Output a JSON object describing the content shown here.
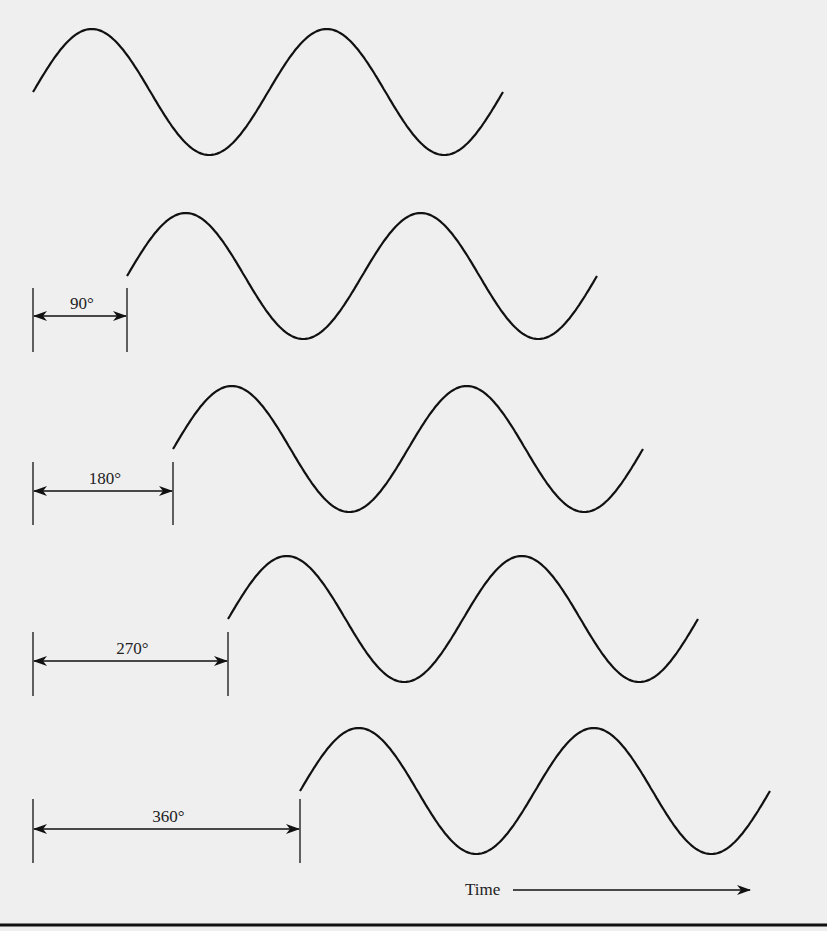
{
  "figure": {
    "waves": [
      {
        "name": "reference",
        "phase_deg": 0,
        "start_x": 33,
        "mid_y": 92
      },
      {
        "name": "shift-90",
        "phase_deg": 90,
        "start_x": 127,
        "mid_y": 276
      },
      {
        "name": "shift-180",
        "phase_deg": 180,
        "start_x": 173,
        "mid_y": 449
      },
      {
        "name": "shift-270",
        "phase_deg": 270,
        "start_x": 228,
        "mid_y": 619
      },
      {
        "name": "shift-360",
        "phase_deg": 360,
        "start_x": 300,
        "mid_y": 791
      }
    ],
    "dimension_labels": [
      {
        "text": "90°",
        "x1": 33,
        "x2": 127,
        "y": 316,
        "tick_top": 288,
        "tick_bottom": 352
      },
      {
        "text": "180°",
        "x1": 33,
        "x2": 173,
        "y": 491,
        "tick_top": 462,
        "tick_bottom": 525
      },
      {
        "text": "270°",
        "x1": 33,
        "x2": 228,
        "y": 661,
        "tick_top": 632,
        "tick_bottom": 696
      },
      {
        "text": "360°",
        "x1": 33,
        "x2": 300,
        "y": 829,
        "tick_top": 799,
        "tick_bottom": 863
      }
    ],
    "time_axis": {
      "label": "Time",
      "arrow_x1": 513,
      "arrow_x2": 750,
      "y": 890
    },
    "wave_period_px": 235,
    "wave_amplitude_px": 63,
    "wave_cycles": 2,
    "colors": {
      "ink": "#111111",
      "background": "#efefef"
    }
  }
}
